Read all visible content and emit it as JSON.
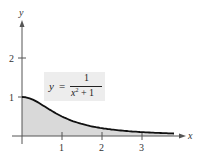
{
  "chart_data": {
    "type": "area",
    "title": "",
    "function": "y = 1/(x^2 + 1)",
    "annotation": {
      "lhs": "y",
      "equals": "=",
      "numerator": "1",
      "denominator_var": "x",
      "denominator_exp": "2",
      "denominator_rest": " + 1"
    },
    "xlabel": "x",
    "ylabel": "y",
    "xlim": [
      0,
      4
    ],
    "ylim": [
      0,
      2.8
    ],
    "x_ticks": [
      "1",
      "2",
      "3"
    ],
    "y_ticks": [
      "1",
      "2"
    ],
    "x": [
      0,
      0.25,
      0.5,
      0.75,
      1,
      1.5,
      2,
      2.5,
      3,
      3.5,
      3.8
    ],
    "values": [
      1.0,
      0.941,
      0.8,
      0.64,
      0.5,
      0.308,
      0.2,
      0.138,
      0.1,
      0.075,
      0.065
    ],
    "fill_color": "#d9d9d9",
    "curve_color": "#111111",
    "axis_color": "#555555",
    "grid": false,
    "legend": "none"
  }
}
